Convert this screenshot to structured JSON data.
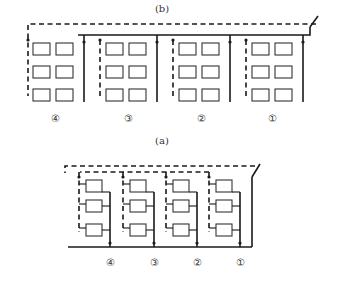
{
  "figure": {
    "orientation": "rotated 180 degrees",
    "colors": {
      "line": "#1a1a1a",
      "background": "#ffffff"
    }
  },
  "diagrams": [
    {
      "id": "a",
      "caption": "(a)",
      "radiators_per_riser": 1,
      "floors": 3,
      "risers": [
        {
          "label": "①"
        },
        {
          "label": "②"
        },
        {
          "label": "③"
        },
        {
          "label": "④"
        }
      ]
    },
    {
      "id": "b",
      "caption": "(b)",
      "radiators_per_riser": 2,
      "floors": 3,
      "risers": [
        {
          "label": "①"
        },
        {
          "label": "②"
        },
        {
          "label": "③"
        },
        {
          "label": "④"
        }
      ]
    }
  ],
  "legend": {
    "solid_line": "supply pipe",
    "dashed_line": "return pipe"
  }
}
